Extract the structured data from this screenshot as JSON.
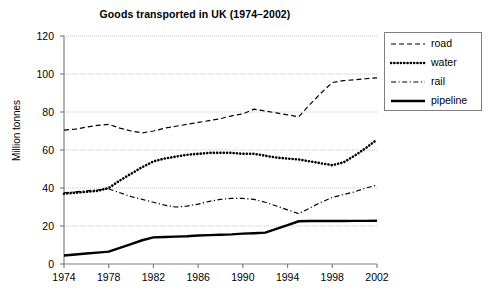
{
  "chart_data": {
    "type": "line",
    "title": "Goods transported in UK (1974–2002)",
    "xlabel": "",
    "ylabel": "Million tonnes",
    "xlim": [
      1974,
      2002
    ],
    "ylim": [
      0,
      120
    ],
    "xticks": [
      "1974",
      "1978",
      "1982",
      "1986",
      "1990",
      "1994",
      "1998",
      "2002"
    ],
    "yticks": [
      "0",
      "20",
      "40",
      "60",
      "80",
      "100",
      "120"
    ],
    "grid": true,
    "legend_position": "right-top",
    "x": [
      1974,
      1975,
      1976,
      1977,
      1978,
      1979,
      1980,
      1981,
      1982,
      1983,
      1984,
      1985,
      1986,
      1987,
      1988,
      1989,
      1990,
      1991,
      1992,
      1993,
      1994,
      1995,
      1996,
      1997,
      1998,
      1999,
      2000,
      2001,
      2002
    ],
    "series": [
      {
        "name": "road",
        "style": "dashed",
        "values": [
          70.5,
          71.0,
          72.0,
          73.0,
          73.5,
          71.5,
          70.0,
          69.0,
          70.0,
          71.5,
          72.5,
          73.5,
          74.5,
          75.5,
          76.5,
          78.0,
          79.0,
          81.5,
          80.5,
          79.5,
          78.5,
          77.5,
          84.0,
          90.0,
          95.5,
          96.5,
          97.0,
          97.5,
          98.0
        ]
      },
      {
        "name": "water",
        "style": "dotted",
        "values": [
          37.0,
          37.5,
          38.0,
          38.5,
          40.0,
          44.0,
          47.5,
          51.0,
          54.0,
          55.5,
          56.5,
          57.5,
          58.0,
          58.5,
          58.5,
          58.5,
          58.0,
          58.0,
          57.0,
          56.0,
          55.5,
          55.0,
          54.0,
          53.0,
          52.0,
          53.5,
          57.0,
          61.0,
          65.5
        ]
      },
      {
        "name": "rail",
        "style": "dashdot",
        "values": [
          37.5,
          38.0,
          38.5,
          39.0,
          39.5,
          37.5,
          35.5,
          34.0,
          32.5,
          31.0,
          30.0,
          30.5,
          31.5,
          33.0,
          34.0,
          34.5,
          34.5,
          34.0,
          32.5,
          30.5,
          28.5,
          26.5,
          29.5,
          32.5,
          35.0,
          36.5,
          38.0,
          40.0,
          41.5
        ]
      },
      {
        "name": "pipeline",
        "style": "solid",
        "values": [
          4.5,
          5.0,
          5.5,
          6.0,
          6.5,
          8.5,
          10.5,
          12.5,
          14.0,
          14.2,
          14.4,
          14.6,
          15.0,
          15.2,
          15.4,
          15.6,
          16.0,
          16.2,
          16.5,
          18.5,
          20.5,
          22.5,
          22.6,
          22.6,
          22.6,
          22.6,
          22.7,
          22.7,
          22.8
        ]
      }
    ]
  },
  "legend": {
    "items": [
      {
        "label": "road"
      },
      {
        "label": "water"
      },
      {
        "label": "rail"
      },
      {
        "label": "pipeline"
      }
    ]
  }
}
